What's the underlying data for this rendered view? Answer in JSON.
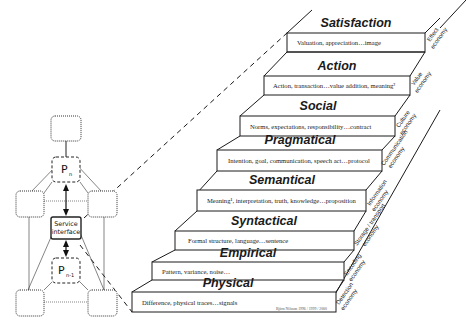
{
  "diagram": {
    "stairs": [
      {
        "level": "Satisfaction",
        "description": "Valuation, appreciation…image",
        "economy": [
          "Effect",
          "economy"
        ]
      },
      {
        "level": "Action",
        "description": "Action, transaction…value addition, meaning²",
        "economy": [
          "Value",
          "economy"
        ]
      },
      {
        "level": "Social",
        "description": "Norms, expectations, responsibility…contract",
        "economy": [
          "Culture",
          "economy"
        ]
      },
      {
        "level": "Pragmatical",
        "description": "Intention, goal, communication, speech act…protocol",
        "economy": [
          "Communication",
          "economy"
        ]
      },
      {
        "level": "Semantical",
        "description": "Meaning¹, interpretation, truth, knowledge…proposition",
        "economy": [
          "Information",
          "economy"
        ]
      },
      {
        "level": "Syntactical",
        "description": "Formal structure, language…sentence",
        "economy": [
          "Storage / transport",
          "economy"
        ]
      },
      {
        "level": "Empirical",
        "description": "Pattern, variance, noise…",
        "economy": [
          "Encoding",
          "economy"
        ]
      },
      {
        "level": "Physical",
        "description": "Difference, physical traces…signals",
        "economy": [
          "Detection",
          "economy"
        ]
      }
    ],
    "credit": "Björn Nilsson 1996 / 1999 / 2000",
    "left_network": {
      "upper_node": "P",
      "upper_sub": "n",
      "center_node_line1": "Service",
      "center_node_line2": "interface",
      "lower_node": "P",
      "lower_sub": "n-1"
    }
  }
}
